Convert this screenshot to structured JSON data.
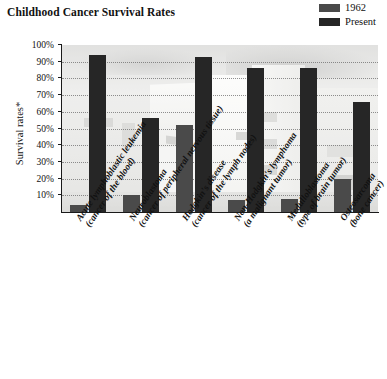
{
  "title": "Childhood Cancer Survival Rates",
  "legend": {
    "position": "top-right",
    "entries": [
      {
        "label": "1962",
        "color": "#4a4a4a",
        "name": "legend-swatch-1962"
      },
      {
        "label": "Present",
        "color": "#262626",
        "name": "legend-swatch-present"
      }
    ]
  },
  "axes": {
    "ylabel": "Survival rates*",
    "yticks": [
      "10%",
      "20%",
      "30%",
      "40%",
      "50%",
      "60%",
      "70%",
      "80%",
      "90%",
      "100%"
    ],
    "ytick_values": [
      10,
      20,
      30,
      40,
      50,
      60,
      70,
      80,
      90,
      100
    ]
  },
  "chart_data": {
    "type": "bar",
    "title": "Childhood Cancer Survival Rates",
    "xlabel": "",
    "ylabel": "Survival rates*",
    "ylim": [
      0,
      100
    ],
    "grid": true,
    "legend_position": "top-right",
    "categories": [
      "Acute lymphoblastic leukemia\n(cancer of the blood)",
      "Neuroblastoma\n(cancer of peripheral nervous tissue)",
      "Hodgkin's disease\n(cancer of the lymph nodes)",
      "Non-Hodgkin's lymphoma\n(a malignant tumor)",
      "Medulloblastoma\n(type of brain tumor)",
      "Osteosarcoma\n(bone cancer)"
    ],
    "category_labels": [
      {
        "main": "Acute lymphoblastic leukemia",
        "sub": "(cancer of the blood)"
      },
      {
        "main": "Neuroblastoma",
        "sub": "(cancer of peripheral nervous tissue)"
      },
      {
        "main": "Hodgkin's disease",
        "sub": "(cancer of the lymph nodes)"
      },
      {
        "main": "Non-Hodgkin's lymphoma",
        "sub": "(a malignant tumor)"
      },
      {
        "main": "Medulloblastoma",
        "sub": "(type of brain tumor)"
      },
      {
        "main": "Osteosarcoma",
        "sub": "(bone cancer)"
      }
    ],
    "series": [
      {
        "name": "1962",
        "color": "#4a4a4a",
        "values": [
          4,
          10,
          52,
          7,
          8,
          20
        ]
      },
      {
        "name": "Present",
        "color": "#262626",
        "values": [
          94,
          56,
          93,
          86,
          86,
          66
        ]
      }
    ]
  }
}
